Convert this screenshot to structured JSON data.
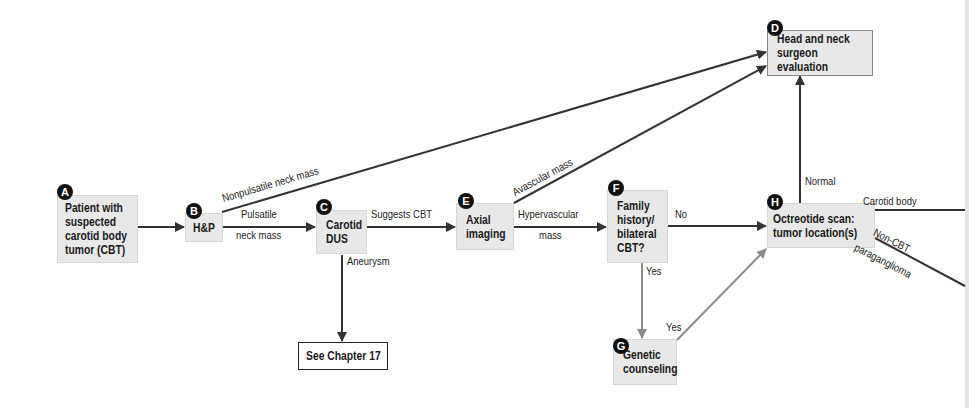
{
  "diagram": {
    "type": "clinical-flowchart",
    "colors": {
      "node_fill": "#e8e8e8",
      "arrow_dark": "#333333",
      "arrow_gray": "#8c8c8c",
      "badge": "#111111"
    },
    "nodes": [
      {
        "id": "A",
        "label": "Patient with\nsuspected\ncarotid body\ntumor (CBT)"
      },
      {
        "id": "B",
        "label": "H&P"
      },
      {
        "id": "C",
        "label": "Carotid\nDUS"
      },
      {
        "id": "D",
        "label": "Head and neck\nsurgeon evaluation"
      },
      {
        "id": "E",
        "label": "Axial\nimaging"
      },
      {
        "id": "F",
        "label": "Family\nhistory/\nbilateral\nCBT?"
      },
      {
        "id": "G",
        "label": "Genetic\ncounseling"
      },
      {
        "id": "H",
        "label": "Octreotide scan:\ntumor location(s)"
      },
      {
        "id": "ref",
        "label": "See Chapter 17"
      }
    ],
    "edges": [
      {
        "from": "A",
        "to": "B",
        "label": ""
      },
      {
        "from": "B",
        "to": "D",
        "label": "Nonpulsatile neck mass"
      },
      {
        "from": "B",
        "to": "C",
        "label_line1": "Pulsatile",
        "label_line2": "neck mass"
      },
      {
        "from": "C",
        "to": "E",
        "label": "Suggests CBT"
      },
      {
        "from": "C",
        "to": "ref",
        "label": "Aneurysm"
      },
      {
        "from": "E",
        "to": "D",
        "label": "Avascular mass"
      },
      {
        "from": "E",
        "to": "F",
        "label_line1": "Hypervascular",
        "label_line2": "mass"
      },
      {
        "from": "F",
        "to": "H",
        "label": "No"
      },
      {
        "from": "F",
        "to": "G",
        "label": "Yes"
      },
      {
        "from": "G",
        "to": "H",
        "label": "Yes"
      },
      {
        "from": "H",
        "to": "D",
        "label": "Normal"
      },
      {
        "from": "H",
        "to": "offscreen-1",
        "label": "Carotid body"
      },
      {
        "from": "H",
        "to": "offscreen-2",
        "label_line1": "Non-CBT",
        "label_line2": "paraganglioma"
      }
    ]
  }
}
